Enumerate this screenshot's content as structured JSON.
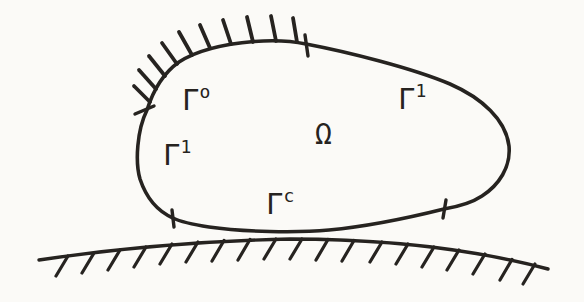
{
  "colors": {
    "ink": "#262320",
    "paper": "#fbfaf7"
  },
  "diagram": {
    "omega": {
      "text": "Ω",
      "x": 315,
      "y": 121
    },
    "boundary_labels": [
      {
        "id": "gamma-0",
        "text": "Γ",
        "sup": "o",
        "x": 182,
        "y": 86
      },
      {
        "id": "gamma-1-left",
        "text": "Γ",
        "sup": "1",
        "x": 163,
        "y": 141
      },
      {
        "id": "gamma-1-right",
        "text": "Γ",
        "sup": "1",
        "x": 398,
        "y": 85
      },
      {
        "id": "gamma-c",
        "text": "Γ",
        "sup": "c",
        "x": 266,
        "y": 190
      }
    ],
    "body_outline": "M 147,110 C 153,91 162,74 179,62 C 196,51 224,44 254,41.5 C 272,40 292,41 306,44 C 348,52 412,68 450,84 C 482,98 506,120 509,146 C 511,167 499,185 482,196 C 470,204 456,207 444,209 C 416,216 372,226 329,230 C 297,233 243,232 209,227 C 196,225 181,222 173,218 C 157,211 146,197 140,179 C 135,162 137,130 147,110 Z",
    "obstacle_line": "M 39,260 C 120,248 200,241 290,239 C 380,239 465,247 548,269",
    "body_hatches": [
      [
        150,
        102,
        134,
        86
      ],
      [
        156,
        89,
        139,
        70
      ],
      [
        165,
        76,
        149,
        56
      ],
      [
        177,
        64,
        162,
        43
      ],
      [
        192,
        55,
        179,
        32
      ],
      [
        210,
        48,
        200,
        25
      ],
      [
        231,
        44,
        223,
        20
      ],
      [
        253,
        42,
        247,
        17
      ],
      [
        276,
        41,
        271,
        16
      ],
      [
        297,
        42,
        293,
        18
      ]
    ],
    "obstacle_hatches": [
      [
        68,
        256,
        56,
        276
      ],
      [
        94,
        253,
        82,
        273
      ],
      [
        120,
        250,
        108,
        270
      ],
      [
        146,
        247,
        134,
        267
      ],
      [
        172,
        244,
        160,
        264
      ],
      [
        198,
        242,
        186,
        262
      ],
      [
        224,
        240.5,
        212,
        261
      ],
      [
        250,
        239.5,
        238,
        260
      ],
      [
        276,
        239,
        264,
        259
      ],
      [
        302,
        239,
        290,
        259
      ],
      [
        328,
        239.5,
        316,
        260
      ],
      [
        354,
        240.5,
        342,
        261
      ],
      [
        382,
        242,
        370,
        262
      ],
      [
        408,
        244,
        396,
        264
      ],
      [
        434,
        247,
        422,
        267
      ],
      [
        459,
        250,
        447,
        270
      ],
      [
        485,
        254,
        473,
        274
      ],
      [
        512,
        259.5,
        500,
        280
      ],
      [
        535,
        264,
        523,
        284
      ]
    ],
    "ticks": [
      [
        135,
        114,
        154,
        106
      ],
      [
        305,
        35,
        308,
        56
      ],
      [
        172,
        210,
        174,
        227
      ],
      [
        446,
        200,
        443,
        218
      ]
    ]
  }
}
